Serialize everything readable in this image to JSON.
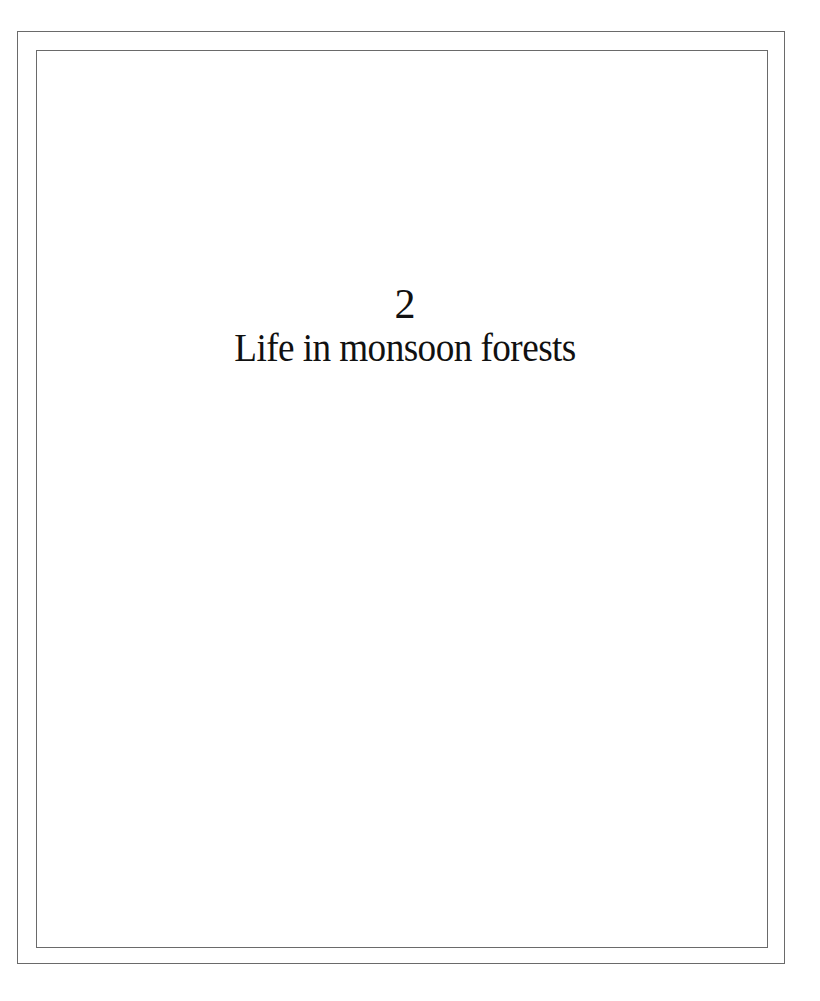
{
  "page": {
    "chapter_number": "2",
    "chapter_title": "Life in monsoon forests",
    "frame_color": "#6a6a6a",
    "text_color": "#111111",
    "background_color": "#ffffff"
  }
}
